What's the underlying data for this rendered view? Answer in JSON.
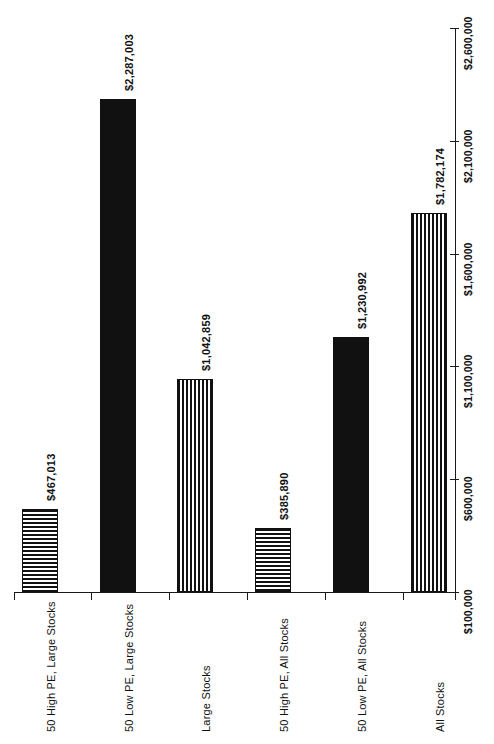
{
  "chart_data": {
    "type": "bar",
    "title": "",
    "xlabel": "",
    "ylabel": "",
    "orientation": "vertical-bars-rotated-90",
    "categories": [
      "50 High PE, Large Stocks",
      "50 Low PE, Large Stocks",
      "Large Stocks",
      "50 High PE, All Stocks",
      "50 Low PE, All Stocks",
      "All Stocks"
    ],
    "values": [
      467013,
      2287003,
      1042859,
      385890,
      1230992,
      1782174
    ],
    "value_labels": [
      "$467,013",
      "$2,287,003",
      "$1,042,859",
      "$385,890",
      "$1,230,992",
      "$1,782,174"
    ],
    "fills": [
      "hhatch",
      "solid",
      "vhatch",
      "hhatch",
      "solid",
      "vhatch"
    ],
    "ylim": [
      100000,
      2600000
    ],
    "ytick_values": [
      100000,
      600000,
      1100000,
      1600000,
      2100000,
      2600000
    ],
    "ytick_labels": [
      "$100,000",
      "$600,000",
      "$1,100,000",
      "$1,600,000",
      "$2,100,000",
      "$2,600,000"
    ],
    "grid": false,
    "legend": null,
    "colors": {
      "ink": "#111111",
      "background": "#ffffff"
    }
  }
}
